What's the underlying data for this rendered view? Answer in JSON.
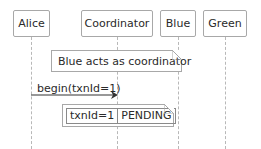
{
  "diagram": {
    "type": "sequence",
    "participants": [
      {
        "name": "Alice"
      },
      {
        "name": "Coordinator"
      },
      {
        "name": "Blue"
      },
      {
        "name": "Green"
      }
    ],
    "notes": [
      {
        "text": "Blue acts as coordinator",
        "over": [
          "Alice",
          "Blue"
        ]
      }
    ],
    "messages": [
      {
        "from": "Alice",
        "to": "Coordinator",
        "label": "begin(txnId=1)"
      }
    ],
    "state_note": {
      "cells": [
        "txnId=1",
        "PENDING"
      ]
    },
    "colors": {
      "border": "#a8a8a8",
      "lifeline": "#b8b8b8",
      "arrow": "#333333",
      "text": "#2a2a2a"
    }
  }
}
